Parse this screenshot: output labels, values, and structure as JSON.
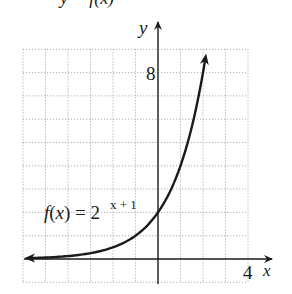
{
  "header_fragment": "y = f(x)",
  "chart_data": {
    "type": "line",
    "title": "",
    "function_label": "f(x) = 2^(x + 1)",
    "function_label_parts": {
      "lhs": "f(x) = 2",
      "exponent": "x + 1"
    },
    "xlabel": "x",
    "ylabel": "y",
    "xlim": [
      -6,
      4
    ],
    "ylim": [
      -1,
      9
    ],
    "grid": true,
    "grid_style": "dotted",
    "tick_labels": {
      "x": [
        "4"
      ],
      "y": [
        "8"
      ]
    },
    "series": [
      {
        "name": "f(x) = 2^(x+1)",
        "x": [
          -5.8,
          -5,
          -4,
          -3,
          -2,
          -1,
          0,
          1,
          2,
          2.1
        ],
        "values": [
          0.036,
          0.0625,
          0.125,
          0.25,
          0.5,
          1,
          2,
          4,
          8,
          8.57
        ]
      }
    ],
    "y_intercept": 2,
    "asymptote": "y = 0",
    "color": "#1a1a1a"
  }
}
